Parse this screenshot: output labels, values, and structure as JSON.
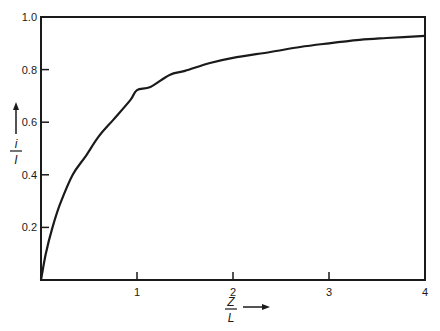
{
  "chart_data": {
    "type": "line",
    "title": "",
    "xlabel": "Z/L",
    "ylabel": "i/I",
    "xlabel_parts": {
      "numerator": "Z",
      "denominator": "L"
    },
    "ylabel_parts": {
      "numerator": "i",
      "denominator": "I"
    },
    "xlim": [
      0,
      4
    ],
    "ylim": [
      0,
      1.0
    ],
    "xticks": [
      1,
      2,
      3,
      4
    ],
    "xtick_labels": [
      "1",
      "2",
      "3",
      "4"
    ],
    "yticks": [
      0.2,
      0.4,
      0.6,
      0.8,
      1.0
    ],
    "ytick_labels": [
      "0.2",
      "0.4",
      "0.6",
      "0.8",
      "1.0"
    ],
    "grid": false,
    "legend": null,
    "series": [
      {
        "name": "i/I vs Z/L",
        "x": [
          0,
          0.05,
          0.12,
          0.2,
          0.33,
          0.46,
          0.6,
          0.75,
          0.93,
          1.0,
          1.14,
          1.34,
          1.5,
          1.76,
          2.0,
          2.39,
          2.7,
          3.0,
          3.32,
          3.6,
          4.0
        ],
        "y": [
          0,
          0.1,
          0.2,
          0.29,
          0.4,
          0.468,
          0.545,
          0.608,
          0.684,
          0.722,
          0.734,
          0.78,
          0.795,
          0.825,
          0.845,
          0.867,
          0.886,
          0.9,
          0.913,
          0.92,
          0.928
        ]
      }
    ]
  }
}
